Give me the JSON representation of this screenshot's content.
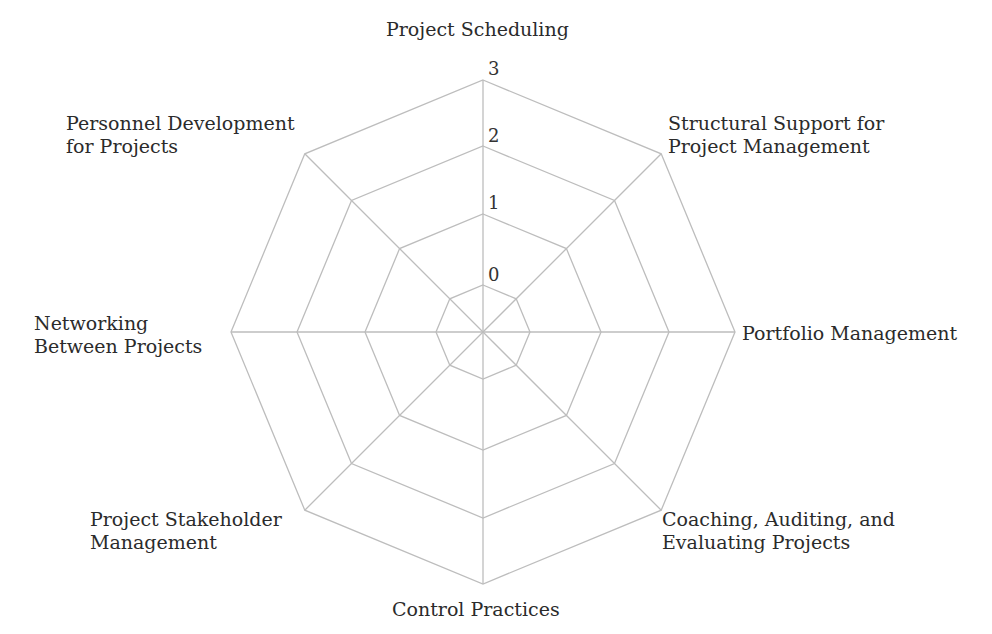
{
  "chart_data": {
    "type": "radar",
    "title": "",
    "axes": [
      "Project Scheduling",
      "Structural Support for Project Management",
      "Portfolio Management",
      "Coaching, Auditing, and Evaluating Projects",
      "Control Practices",
      "Project Stakeholder Management",
      "Networking Between Projects",
      "Personnel Development for Projects"
    ],
    "scale_ticks": [
      "0",
      "1",
      "2",
      "3"
    ],
    "range": [
      0,
      3
    ],
    "series": [],
    "grid": true,
    "grid_color": "#bdbdbd"
  },
  "labels": {
    "top": [
      "Project Scheduling"
    ],
    "top_right": [
      "Structural Support for",
      "Project Management"
    ],
    "right": [
      "Portfolio Management"
    ],
    "bottom_right": [
      "Coaching, Auditing, and",
      "Evaluating Projects"
    ],
    "bottom": [
      "Control Practices"
    ],
    "bottom_left": [
      "Project Stakeholder",
      "Management"
    ],
    "left": [
      "Networking",
      "Between Projects"
    ],
    "top_left": [
      "Personnel Development",
      "for Projects"
    ]
  },
  "ticks": {
    "t0": "0",
    "t1": "1",
    "t2": "2",
    "t3": "3"
  }
}
